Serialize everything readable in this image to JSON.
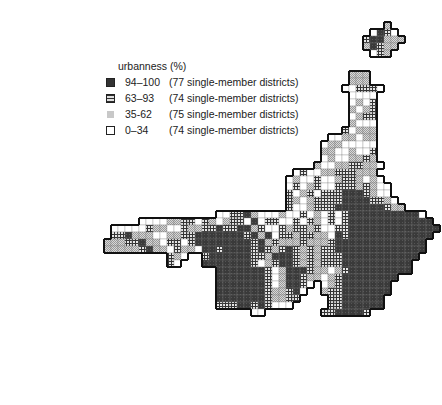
{
  "legend": {
    "title": "urbanness (%)",
    "items": [
      {
        "key": "D",
        "range": "94–100",
        "count": "(77 single-member districts)"
      },
      {
        "key": "C",
        "range": "63–93",
        "count": "(74 single-member districts)"
      },
      {
        "key": "S",
        "range": "35-62",
        "count": "(75 single-member districts)"
      },
      {
        "key": "W",
        "range": "0–34",
        "count": "(74 single-member districts)"
      }
    ]
  },
  "chart_data": {
    "type": "heatmap",
    "legend_title": "urbanness (%)",
    "categories": [
      "94–100",
      "63–93",
      "35-62",
      "0–34"
    ],
    "values": [
      77,
      74,
      75,
      74
    ],
    "value_label": "single-member districts",
    "cell_size": 7,
    "note": "Each cell is one district; fill encodes urbanness class (D=94–100, C=63–93, S=35–62, W=0–34); thick outlines mark prefecture blocks.",
    "rows": [
      {
        "r": 3,
        "c": 55,
        "cells": "S"
      },
      {
        "r": 4,
        "c": 53,
        "cells": "WDCW"
      },
      {
        "r": 5,
        "c": 52,
        "cells": "CDDSSS"
      },
      {
        "r": 6,
        "c": 52,
        "cells": "SDCSS"
      },
      {
        "r": 7,
        "c": 53,
        "cells": "WCS"
      },
      {
        "r": 8,
        "c": 53,
        "cells": ""
      },
      {
        "r": 10,
        "c": 50,
        "cells": "SSS"
      },
      {
        "r": 11,
        "c": 50,
        "cells": "SSS"
      },
      {
        "r": 12,
        "c": 49,
        "cells": "WWCCCW"
      },
      {
        "r": 13,
        "c": 50,
        "cells": "WWWW"
      },
      {
        "r": 14,
        "c": 50,
        "cells": "WSWC"
      },
      {
        "r": 15,
        "c": 50,
        "cells": "SWSC"
      },
      {
        "r": 16,
        "c": 50,
        "cells": "WSCC"
      },
      {
        "r": 17,
        "c": 50,
        "cells": "SWWW"
      },
      {
        "r": 18,
        "c": 49,
        "cells": "CWSSS"
      },
      {
        "r": 19,
        "c": 47,
        "cells": "WWSSWSS"
      },
      {
        "r": 20,
        "c": 46,
        "cells": "WSSWWWWW"
      },
      {
        "r": 21,
        "c": 46,
        "cells": "SSWWSWWC"
      },
      {
        "r": 22,
        "c": 46,
        "cells": "WSWWSSCS"
      },
      {
        "r": 23,
        "c": 45,
        "cells": "SWWSSCCSSW"
      },
      {
        "r": 24,
        "c": 42,
        "cells": "WCWWSSCCCSSS"
      },
      {
        "r": 25,
        "c": 41,
        "cells": "WSWWCWWSCCSWSW"
      },
      {
        "r": 26,
        "c": 41,
        "cells": "WCWSCWWCCCSCSWW"
      },
      {
        "r": 27,
        "c": 41,
        "cells": "CWSCWCCCDDDCSWW"
      },
      {
        "r": 28,
        "c": 41,
        "cells": "CSWSCCCCDDDDCCSW"
      },
      {
        "r": 29,
        "c": 41,
        "cells": "CWWSCCCDDDDDDDCSS"
      },
      {
        "r": 30,
        "c": 31,
        "cells": "WWCCDSWWWSWWCWSWCWCDDDDDDDDDDW"
      },
      {
        "r": 31,
        "c": 20,
        "cells": "WWWWSSCCWCSWSCCWDWCCWWCWCSWCWCDDDDDDDDDDDD"
      },
      {
        "r": 32,
        "c": 16,
        "cells": "WWWWWCSSWWCSSCCDCCDDSCWWCSCCSCWWCCDDDDDDDDDDDDD"
      },
      {
        "r": 33,
        "c": 16,
        "cells": "CCDSSSWWSSCCDDDDDDDCDSDWCCSCCSSWDCDDDDDDDDDDDD"
      },
      {
        "r": 34,
        "c": 15,
        "cells": "SSSCCDSSWCCWCDDDDDDDDCDSCSSSCSSSCDDDDDDDDDDDDD"
      },
      {
        "r": 35,
        "c": 15,
        "cells": "SSSSSCDSSWCSSWDDCDDDDCDCSCDCSCSCCDDDDDDDDDDDDD"
      },
      {
        "r": 36,
        "c": 24,
        "cells": "CSW  CDDDDDDCCSDDDCSCSCCCDDDDDDDDDDD"
      },
      {
        "r": 37,
        "c": 24,
        "cells": "CW   DDDDDDDCWSCDDCSCSCCCDDDDDDDDDD"
      },
      {
        "r": 38,
        "c": 31,
        "cells": "DDDDDDDCWSDDDCSSWSCDDDDDDDDD"
      },
      {
        "r": 39,
        "c": 31,
        "cells": "DDDDDDDCWSDDCSSWSCDDDDDDDD"
      },
      {
        "r": 40,
        "c": 31,
        "cells": "DDDDDDDCWSDDCW WSCDDDDDDD"
      },
      {
        "r": 41,
        "c": 31,
        "cells": "DDDDDDDCSSCDW  SCCDDDDDDD"
      },
      {
        "r": 42,
        "c": 31,
        "cells": "DDDDDDDCSSCC    CCDDDDDD"
      },
      {
        "r": 43,
        "c": 31,
        "cells": "CCCDDCDCWWW     CCDDDDDD"
      },
      {
        "r": 44,
        "c": 36,
        "cells": "WW        CCDDDDC"
      }
    ]
  },
  "footer": ""
}
